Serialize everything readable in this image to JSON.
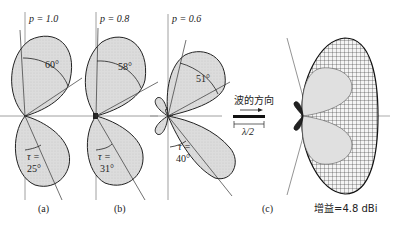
{
  "panels": [
    {
      "id": "a",
      "p_label": "p = 1.0",
      "beam_angle": "60°",
      "tau_label": "τ =",
      "tau_value": "25°",
      "caption": "(a)"
    },
    {
      "id": "b",
      "p_label": "p = 0.8",
      "beam_angle": "58°",
      "tau_label": "τ =",
      "tau_value": "31°",
      "caption": "(b)"
    },
    {
      "id": "c",
      "p_label": "p = 0.6",
      "beam_angle": "51°",
      "tau_label": "τ =",
      "tau_value": "40°",
      "caption": "(c)"
    }
  ],
  "wave_direction": {
    "label": "波的方向",
    "length_label": "λ/2"
  },
  "pattern_3d": {
    "gain_label": "增益=4.8 dBi"
  },
  "colors": {
    "lobe_fill": "#d9d9d9",
    "outline": "#222222",
    "axis": "#888888"
  }
}
